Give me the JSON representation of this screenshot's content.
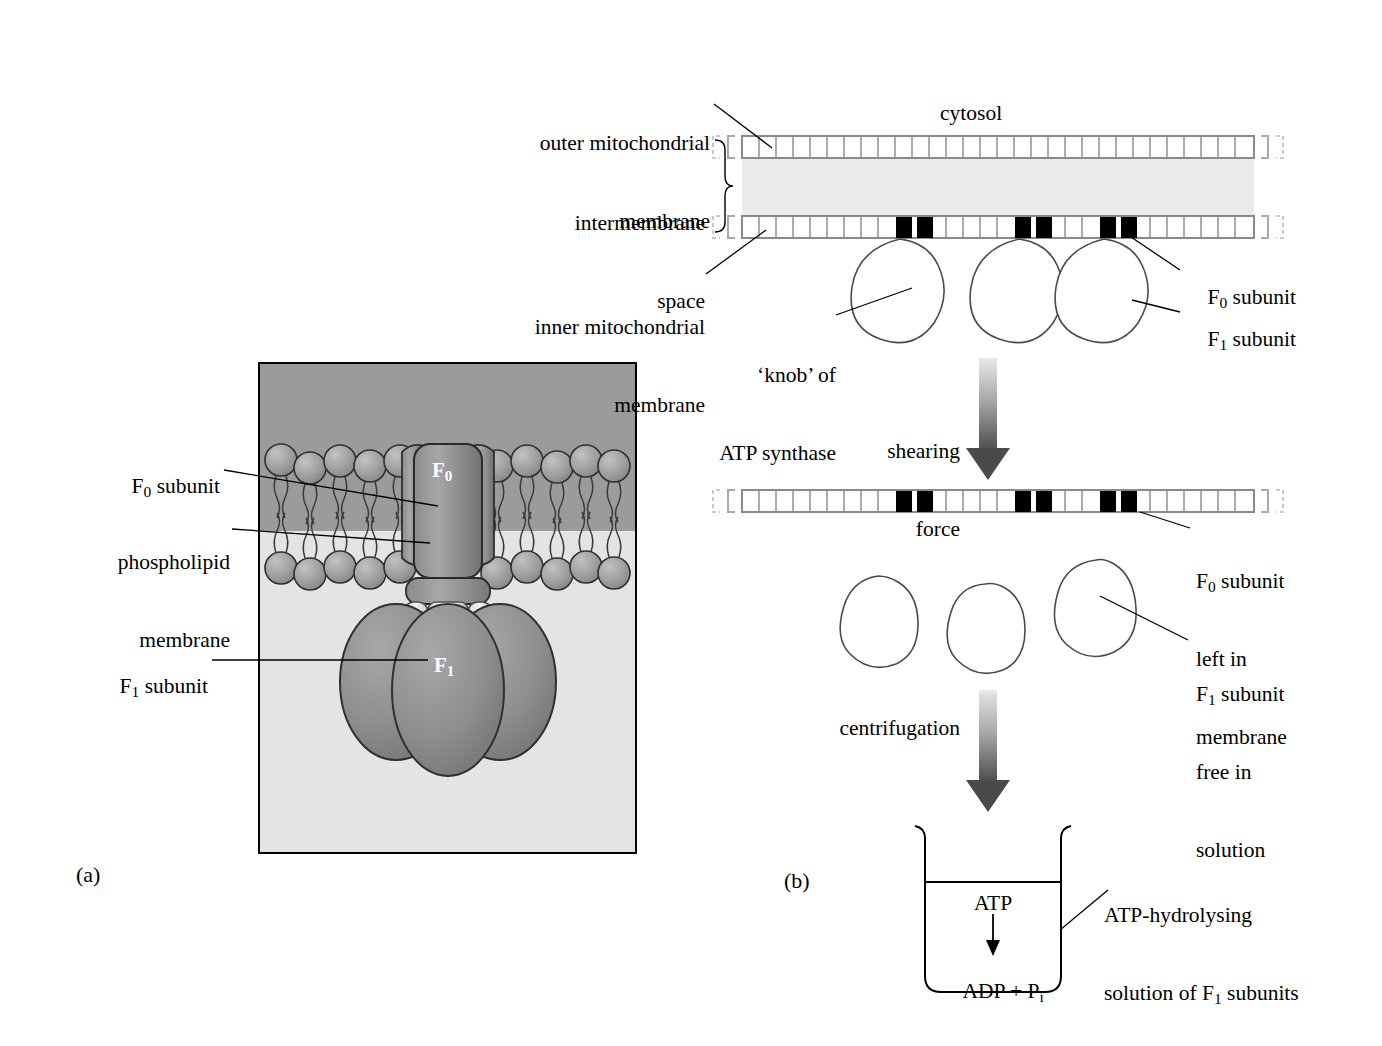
{
  "figure": {
    "panels": [
      {
        "tag": "(a)",
        "name": "panel-a"
      },
      {
        "tag": "(b)",
        "name": "panel-b"
      }
    ]
  },
  "panel_a": {
    "tag": "(a)",
    "labels": {
      "f0_subunit": "F₀ subunit",
      "phospholipid_membrane_line1": "phospholipid",
      "phospholipid_membrane_line2": "membrane",
      "f1_subunit": "F₁ subunit"
    },
    "structure_labels": {
      "f0": "F₀",
      "f1": "F₁"
    },
    "colors": {
      "upper_region": "#9b9b9b",
      "lower_region": "#e4e4e4",
      "protein_fill": "#8e8e8e",
      "lipid_head": "#a2a2a2",
      "frame": "#000000"
    }
  },
  "panel_b": {
    "tag": "(b)",
    "labels": {
      "outer_membrane_line1": "outer mitochondrial",
      "outer_membrane_line2": "membrane",
      "intermembrane_line1": "intermembrane",
      "intermembrane_line2": "space",
      "inner_membrane_line1": "inner mitochondrial",
      "inner_membrane_line2": "membrane",
      "cytosol": "cytosol",
      "knob_line1": "‘knob’ of",
      "knob_line2": "ATP synthase",
      "f0_subunit": "F₀ subunit",
      "f1_subunit": "F₁ subunit",
      "shearing_line1": "shearing",
      "shearing_line2": "force",
      "centrifugation": "centrifugation",
      "f0_left_line1": "F₀ subunit",
      "f0_left_line2": "left in",
      "f0_left_line3": "membrane",
      "f1_free_line1": "F₁ subunit",
      "f1_free_line2": "free in",
      "f1_free_line3": "solution",
      "beaker_label_line1": "ATP-hydrolysing",
      "beaker_label_line2": "solution of F₁ subunits"
    },
    "beaker": {
      "reactant": "ATP",
      "product": "ADP + Pᵢ"
    },
    "arrows": [
      {
        "name": "shearing-force-arrow",
        "label": "shearing force"
      },
      {
        "name": "centrifugation-arrow",
        "label": "centrifugation"
      }
    ],
    "membrane": {
      "f0_block_count": 3,
      "intermembrane_fill": "#ebebeb",
      "segment_stroke": "#8a8a8a",
      "f0_fill": "#000000"
    }
  }
}
